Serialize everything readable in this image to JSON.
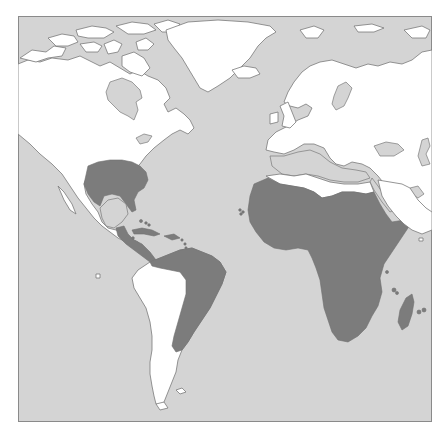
{
  "map": {
    "type": "distribution-range-map",
    "projection_extent": "North & South America, Europe, Africa, Middle East",
    "legend": [],
    "colors": {
      "ocean": "#d4d4d4",
      "land": "#ffffff",
      "range": "#7c7c7c",
      "coastline": "#7a7a7a",
      "frame": "#8a8a8a"
    },
    "regions_shaded": [
      "Southeastern United States",
      "Mexico (eastern lowlands) and Central America",
      "Caribbean islands (Cuba, Hispaniola, Bahamas, Lesser Antilles)",
      "Northern and eastern South America (Venezuela, Guianas, eastern Brazil, Uruguay, northeastern Argentina)",
      "Sub-Saharan and North-West Africa",
      "Madagascar",
      "Comoros",
      "Mascarene Islands",
      "Cape Verde Islands"
    ],
    "regions_unshaded": [
      "Canada and Arctic archipelago",
      "Greenland",
      "Iceland",
      "Western South America (Andes, Chile, Patagonia)",
      "Europe",
      "Middle East / Arabia",
      "North African Mediterranean coast (Libya, Egypt coast)"
    ]
  }
}
